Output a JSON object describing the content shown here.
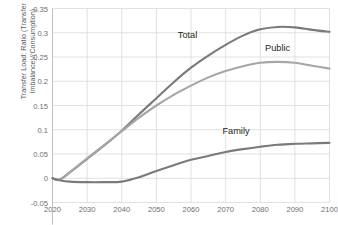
{
  "chart_data": {
    "type": "line",
    "title": "",
    "xlabel": "",
    "ylabel": "Transfer Load: Ratio (Transfer Imbalance)/(Consumption)",
    "xlim": [
      2020,
      2100
    ],
    "ylim": [
      -0.05,
      0.35
    ],
    "grid": true,
    "legend_position": "inline-annotations",
    "xticks": [
      "2020",
      "2030",
      "2040",
      "2050",
      "2060",
      "2070",
      "2080",
      "2090",
      "2100"
    ],
    "yticks": [
      "0.35",
      "0.3",
      "0.25",
      "0.2",
      "0.15",
      "0.1",
      "0.05",
      "0",
      "-0.05"
    ],
    "x": [
      2020,
      2022,
      2025,
      2030,
      2035,
      2040,
      2045,
      2050,
      2055,
      2060,
      2065,
      2070,
      2075,
      2080,
      2085,
      2090,
      2095,
      2100
    ],
    "series": [
      {
        "name": "Total",
        "color": "#7a7a7a",
        "values": [
          0.0,
          -0.003,
          0.012,
          0.04,
          0.068,
          0.098,
          0.132,
          0.165,
          0.198,
          0.228,
          0.253,
          0.275,
          0.294,
          0.307,
          0.312,
          0.311,
          0.306,
          0.302
        ]
      },
      {
        "name": "Public",
        "color": "#a6a6a6",
        "values": [
          0.0,
          -0.003,
          0.012,
          0.041,
          0.069,
          0.097,
          0.125,
          0.15,
          0.172,
          0.191,
          0.208,
          0.221,
          0.231,
          0.238,
          0.24,
          0.238,
          0.232,
          0.226
        ]
      },
      {
        "name": "Family",
        "color": "#7a7a7a",
        "values": [
          0.0,
          -0.004,
          -0.007,
          -0.008,
          -0.008,
          -0.007,
          0.002,
          0.015,
          0.027,
          0.038,
          0.046,
          0.054,
          0.06,
          0.065,
          0.069,
          0.071,
          0.072,
          0.073
        ]
      }
    ],
    "annotations": [
      {
        "text": "Total",
        "x": 2059,
        "y": 0.295
      },
      {
        "text": "Public",
        "x": 2085,
        "y": 0.268
      },
      {
        "text": "Family",
        "x": 2073,
        "y": 0.098
      }
    ]
  },
  "colors": {
    "grid": "#d9d9d9",
    "axis": "#bfbfbf",
    "tick_text": "#6d6e71",
    "label_text": "#58595b",
    "annotation_text": "#231f20",
    "background": "#ffffff"
  }
}
